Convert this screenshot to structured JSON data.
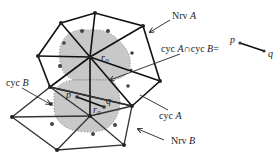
{
  "labels": {
    "nrv_a": "Nrv ",
    "nrv_a_var": "A",
    "nrv_b": "Nrv ",
    "nrv_b_var": "B",
    "cyc_a": "cyc ",
    "cyc_a_var": "A",
    "cyc_b": "cyc ",
    "cyc_b_var": "B",
    "intersection_pre": "cyc ",
    "intersection_a": "A",
    "intersection_op": "∩cyc ",
    "intersection_b": "B",
    "intersection_eq": "=",
    "p": "p",
    "q": "q",
    "seg_p": "p",
    "seg_q": "q",
    "r0_a": "r",
    "r0_a_sub": "0",
    "r0_b": "r",
    "r0_b_sub": "0"
  },
  "colors": {
    "edge": "#111111",
    "region": "#c8c8c8",
    "dot": "#444444",
    "text": "#222222"
  }
}
